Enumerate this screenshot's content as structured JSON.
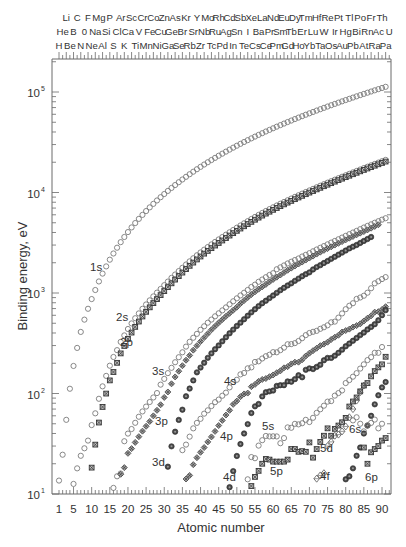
{
  "chart_data": {
    "type": "scatter",
    "title": "",
    "xlabel": "Atomic number",
    "ylabel": "Binding energy, eV",
    "xscale": "linear",
    "yscale": "log",
    "xlim": [
      0,
      93
    ],
    "ylim": [
      10,
      200000
    ],
    "x_ticks": [
      1,
      5,
      10,
      15,
      20,
      25,
      30,
      35,
      40,
      45,
      50,
      55,
      60,
      65,
      70,
      75,
      80,
      85,
      90
    ],
    "y_ticks": [
      {
        "value": 10,
        "base": "10",
        "exp": "1"
      },
      {
        "value": 100,
        "base": "10",
        "exp": "2"
      },
      {
        "value": 1000,
        "base": "10",
        "exp": "3"
      },
      {
        "value": 10000,
        "base": "10",
        "exp": "4"
      },
      {
        "value": 100000,
        "base": "10",
        "exp": "5"
      }
    ],
    "grid": false,
    "legend": "inline shell labels",
    "top_axis_elements": {
      "row1": [
        "Li",
        "C",
        "F",
        "Mg",
        "P",
        "Ar",
        "Sc",
        "Cr",
        "Co",
        "Zn",
        "As",
        "Kr",
        "Y",
        "Mo",
        "Rh",
        "Cd",
        "Sb",
        "Xe",
        "La",
        "Nd",
        "Eu",
        "Dy",
        "Tm",
        "Hf",
        "Re",
        "Pt",
        "Tl",
        "Po",
        "Fr",
        "Th"
      ],
      "row2": [
        "He",
        "B",
        "0",
        "Na",
        "Si",
        "Cl",
        "Ca",
        "V",
        "Fe",
        "Cu",
        "Ge",
        "Br",
        "Sr",
        "Nb",
        "Ru",
        "Ag",
        "Sn",
        "I",
        "Ba",
        "Pr",
        "Sm",
        "Tb",
        "Er",
        "Lu",
        "W",
        "Ir",
        "Hg",
        "Bi",
        "Rn",
        "Ac",
        "U"
      ],
      "row3": [
        "H",
        "Be",
        "N",
        "Ne",
        "Al",
        "S",
        "K",
        "Ti",
        "Mn",
        "Ni",
        "Ga",
        "Se",
        "Rb",
        "Zr",
        "Tc",
        "Pd",
        "In",
        "Te",
        "Cs",
        "Ce",
        "Pm",
        "Gd",
        "Ho",
        "Yb",
        "Ta",
        "Os",
        "Au",
        "Pb",
        "At",
        "Ra",
        "Pa"
      ]
    },
    "series": [
      {
        "name": "1s",
        "marker": "circle-open",
        "label_pos": {
          "x": 90,
          "y": 271
        },
        "start_z": 1,
        "values": [
          13.6,
          24.6,
          54.7,
          111.5,
          188,
          284.2,
          409.9,
          543.1,
          696.7,
          870.2,
          1070.8,
          1303,
          1559.6,
          1839,
          2145.5,
          2472,
          2822.4,
          3205.9,
          3608.4,
          4038.5,
          4492,
          4966,
          5465,
          5989,
          6539,
          7112,
          7709,
          8333,
          8979,
          9659,
          10367,
          11103,
          11867,
          12658,
          13474,
          14326,
          15200,
          16105,
          17038,
          17998,
          18986,
          20000,
          21044,
          22117,
          23220,
          24350,
          25514,
          26711,
          27940,
          29200,
          30491,
          31814,
          33169,
          34561,
          35985,
          37441,
          38925,
          40443,
          41991,
          43569,
          45184,
          46834,
          48519,
          50239,
          51996,
          53789,
          55618,
          57486,
          59390,
          61332,
          63314,
          65351,
          67416,
          69525,
          71676,
          73871,
          76111,
          78395,
          80725,
          83102,
          85530,
          88005,
          90526,
          93105,
          95730,
          98404,
          101137,
          103922,
          106755,
          109651,
          112601,
          115606
        ]
      },
      {
        "name": "2s",
        "marker": "circle-open",
        "label_pos": {
          "x": 116,
          "y": 321
        },
        "start_z": 3,
        "values": [
          5.4,
          9.3,
          12.6,
          18,
          24,
          28.5,
          34,
          48.5,
          63.5,
          88.6,
          117.8,
          149.7,
          189,
          230.9,
          270,
          326.3,
          378.6,
          438.4,
          498,
          560.9,
          626.7,
          696,
          769.1,
          844.6,
          925.1,
          1008.6,
          1096.7,
          1196.2,
          1299,
          1414.6,
          1527,
          1652,
          1782,
          1921,
          2065,
          2216,
          2373,
          2532,
          2698,
          2866,
          3043,
          3224,
          3412,
          3604,
          3806,
          4018,
          4238,
          4465,
          4698,
          4939,
          5188,
          5453,
          5714,
          5989,
          6266,
          6549,
          6835,
          7126,
          7428,
          7737,
          8052,
          8376,
          8708,
          9046,
          9394,
          9751,
          10116,
          10486,
          10870,
          11271,
          11682,
          12100,
          12527,
          12968,
          13419,
          13880,
          14353,
          14839,
          15347,
          15861,
          16388,
          16939,
          17493,
          18049,
          18639,
          19237,
          19840,
          20472,
          21105
        ]
      },
      {
        "name": "2p",
        "marker": "square-x",
        "label_pos": {
          "x": 120,
          "y": 346
        },
        "start_z": 5,
        "values": [
          4.7,
          7.1,
          9.2,
          7.1,
          8.6,
          18.3,
          31,
          51.4,
          73.5,
          99.8,
          135,
          163.6,
          202,
          250.6,
          297.3,
          349.7,
          403.6,
          460.2,
          519.8,
          583.8,
          649.9,
          719.9,
          793.2,
          870,
          952.3,
          1044.9,
          1143.2,
          1248.1,
          1359.1,
          1474.3,
          1596,
          1730.9,
          1864,
          2007,
          2156,
          2307,
          2465,
          2625,
          2793,
          2967,
          3146,
          3330,
          3524,
          3727,
          3938,
          4156,
          4380,
          4612,
          4852,
          5104,
          5359,
          5624,
          5891,
          6164,
          6440,
          6722,
          7013,
          7312,
          7617,
          7930,
          8252,
          8581,
          8918,
          9264,
          9617,
          9978,
          10349,
          10739,
          11136,
          11544,
          11959,
          12385,
          12824,
          13273,
          13734,
          14209,
          14698,
          15200,
          15711,
          16244,
          16785,
          17337,
          17907,
          18484,
          19083,
          19693,
          20314
        ]
      },
      {
        "name": "3s",
        "marker": "circle-open",
        "label_pos": {
          "x": 152,
          "y": 375
        },
        "start_z": 11,
        "values": [
          0,
          0,
          6,
          8,
          10,
          11.5,
          15,
          16,
          33.5,
          39.9,
          44.3,
          51.1,
          58.7,
          66.3,
          74.1,
          82.3,
          91.3,
          101,
          122.5,
          139.8,
          159.5,
          180.1,
          204.7,
          229.6,
          257,
          292.8,
          326.7,
          358.7,
          392,
          430.3,
          466.6,
          506.3,
          544,
          586.1,
          628.1,
          671.6,
          719,
          772,
          827.2,
          884.7,
          946,
          1006,
          1072,
          1148.7,
          1211,
          1293,
          1362,
          1436,
          1511,
          1575,
          1723,
          1800,
          1881,
          1968,
          2047,
          2128,
          2206,
          2307,
          2398,
          2491,
          2601,
          2708,
          2820,
          2932,
          3049,
          3174,
          3296,
          3425,
          3562,
          3704,
          3851,
          3999,
          4149,
          4317,
          4482,
          4652,
          4822,
          5002,
          5182,
          5367,
          5548
        ]
      },
      {
        "name": "3p",
        "marker": "diamond-x",
        "label_pos": {
          "x": 155,
          "y": 425
        },
        "start_z": 13,
        "values": [
          0,
          0,
          0,
          0,
          0,
          15.7,
          18.3,
          25.4,
          28.3,
          32.6,
          37.2,
          42.2,
          47.2,
          52.7,
          59.9,
          68,
          77.3,
          91.4,
          103.5,
          124.9,
          146.2,
          166.5,
          189,
          214.4,
          239.1,
          270,
          299,
          328.8,
          360,
          394,
          430.3,
          466.4,
          505,
          544,
          586.2,
          628.2,
          674.1,
          723.3,
          784.5,
          841.3,
          902.4,
          965,
          1027,
          1091,
          1153,
          1217,
          1292,
          1365,
          1437,
          1511,
          1597,
          1684,
          1768,
          1855,
          1943,
          2031,
          2127,
          2227,
          2328,
          2438,
          2549,
          2656,
          2767,
          2880,
          2998,
          3120,
          3246,
          3378,
          3511,
          3651,
          3794,
          3942,
          4085,
          4246,
          4416,
          4598,
          4775
        ]
      },
      {
        "name": "3d",
        "marker": "filled-dot",
        "label_pos": {
          "x": 152,
          "y": 466
        },
        "start_z": 21,
        "values": [
          0,
          0,
          0,
          0,
          0,
          0,
          0,
          0,
          0,
          10.2,
          18.7,
          29.8,
          41.7,
          54.6,
          69,
          93.8,
          112,
          135,
          162.3,
          181.1,
          202.3,
          226.4,
          251,
          275.8,
          301,
          330.5,
          363,
          397.3,
          432.1,
          470,
          507,
          548,
          594,
          642,
          690,
          741,
          791,
          838,
          890,
          945,
          1004,
          1067,
          1127,
          1189,
          1248,
          1321,
          1391,
          1468,
          1540,
          1605,
          1716,
          1811,
          1893,
          1988,
          2080,
          2186,
          2292,
          2407,
          2523,
          2645,
          2779,
          2891,
          3004,
          3148,
          3296,
          3443,
          3610
        ]
      },
      {
        "name": "4s",
        "marker": "circle-open",
        "label_pos": {
          "x": 224,
          "y": 385
        },
        "start_z": 35,
        "values": [
          27.3,
          31,
          37.2,
          45,
          51,
          56,
          63,
          68,
          75,
          82,
          87,
          95,
          102,
          115,
          130,
          137,
          155,
          160,
          178,
          182,
          206,
          209,
          223,
          235,
          243,
          258,
          257,
          270,
          286,
          309,
          310,
          317,
          333,
          355,
          381,
          400,
          411,
          420,
          440,
          456,
          477,
          511,
          519,
          569,
          626,
          690,
          747,
          791,
          873,
          902,
          939,
          1007,
          1115,
          1248,
          1309,
          1376,
          1439,
          1531,
          1624,
          1711,
          1833
        ]
      },
      {
        "name": "4p",
        "marker": "diamond-x",
        "label_pos": {
          "x": 220,
          "y": 440
        },
        "start_z": 36,
        "values": [
          14.1,
          15.3,
          19.6,
          23,
          26,
          29,
          33,
          37,
          42,
          48,
          54,
          61,
          68,
          78,
          84,
          93,
          99,
          101,
          117,
          123,
          132,
          138,
          141,
          147,
          153,
          161,
          168,
          180,
          185,
          197,
          205,
          205,
          217,
          236,
          252,
          267,
          282,
          299,
          310,
          324,
          345,
          363,
          380,
          409,
          423,
          437,
          458,
          474,
          493,
          526,
          561,
          593,
          645,
          652,
          684,
          731,
          780,
          860,
          944,
          1034
        ]
      },
      {
        "name": "4d",
        "marker": "filled-dot",
        "label_pos": {
          "x": 223,
          "y": 481
        },
        "start_z": 48,
        "values": [
          11.7,
          16.9,
          23.9,
          31.4,
          40,
          49.6,
          63.9,
          74.5,
          78.7,
          93.6,
          103,
          105,
          107,
          119,
          121,
          121,
          132,
          131,
          139,
          152,
          145,
          172,
          178,
          175,
          184,
          193,
          214,
          226,
          226,
          238,
          254,
          273,
          295,
          314,
          335,
          357,
          381,
          404,
          434,
          460,
          489,
          536,
          601,
          675,
          756,
          820,
          873,
          930
        ]
      },
      {
        "name": "5s",
        "marker": "circle-open",
        "label_pos": {
          "x": 262,
          "y": 430
        },
        "start_z": 53,
        "values": [
          14,
          23.3,
          22.7,
          30.3,
          34.3,
          37.8,
          37.4,
          37.5,
          37.4,
          32,
          36,
          46,
          45.6,
          49.9,
          49.3,
          50.6,
          54.7,
          52,
          57.3,
          64.2,
          69.7,
          75.6,
          83,
          84,
          95.2,
          101,
          107.2,
          127,
          136,
          147,
          159.3,
          177,
          195,
          215,
          230,
          254,
          254,
          290
        ]
      },
      {
        "name": "5p",
        "marker": "square-x",
        "label_pos": {
          "x": 270,
          "y": 475
        },
        "start_z": 54,
        "values": [
          12,
          14.8,
          17,
          20,
          22.3,
          22,
          21,
          21,
          21,
          21,
          22,
          28,
          28,
          26.3,
          26.7,
          26.3,
          32.6,
          23,
          28,
          33,
          38,
          45,
          38,
          44.5,
          48,
          51.7,
          57.2,
          74.2,
          83.3,
          91.3,
          105,
          120,
          127,
          148,
          167,
          182,
          195,
          232,
          225
        ]
      },
      {
        "name": "4f",
        "marker": "diamond-open",
        "label_pos": {
          "x": 320,
          "y": 480
        },
        "start_z": 72,
        "values": [
          14.2,
          15.3,
          16.1,
          30,
          33,
          38,
          39,
          42,
          47,
          58,
          70,
          85,
          103,
          120
        ]
      },
      {
        "name": "5d",
        "marker": "filled-dot",
        "label_pos": {
          "x": 320,
          "y": 452
        },
        "start_z": 80,
        "values": [
          14,
          15,
          18,
          24,
          29,
          40,
          48,
          60,
          78,
          96,
          115,
          130,
          144
        ]
      },
      {
        "name": "6s",
        "marker": "circle-open",
        "label_pos": {
          "x": 349,
          "y": 433
        },
        "start_z": 82,
        "values": [
          54,
          58,
          50,
          42,
          48,
          51,
          55,
          45,
          50
        ]
      },
      {
        "name": "6p",
        "marker": "square-x",
        "label_pos": {
          "x": 365,
          "y": 481
        },
        "start_z": 85,
        "values": [
          29,
          20,
          26,
          28,
          30,
          34,
          36
        ]
      }
    ]
  }
}
